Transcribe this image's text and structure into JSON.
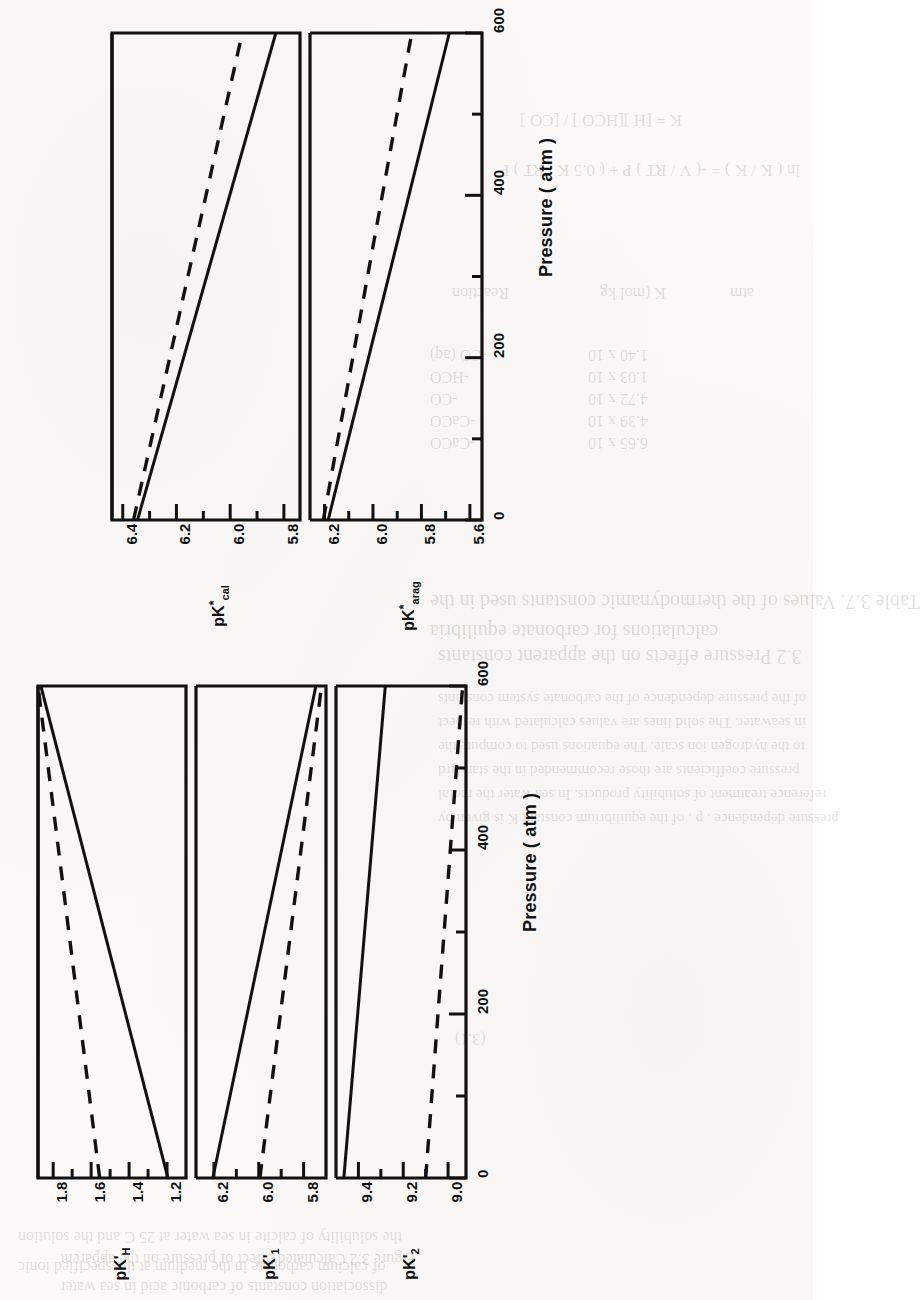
{
  "page": {
    "orientation": "rotated-90-ccw",
    "ghost_text": [
      {
        "t": "Table 3.7. Values of the thermodynamic constants used in the",
        "x": 430,
        "y": 590,
        "s": 20
      },
      {
        "t": "calculations for carbonate equilibria",
        "x": 430,
        "y": 620,
        "s": 20
      },
      {
        "t": "of the pressure dependence of the carbonate system constants",
        "x": 438,
        "y": 690,
        "s": 15
      },
      {
        "t": "in seawater. The solid lines are values calculated with respect",
        "x": 438,
        "y": 714,
        "s": 15
      },
      {
        "t": "to the hydrogen ion scale. The equations used to compute the",
        "x": 438,
        "y": 738,
        "s": 15
      },
      {
        "t": "pressure coefficients are those recommended in the standard",
        "x": 438,
        "y": 762,
        "s": 15
      },
      {
        "t": "reference treatment of solubility products. In sea water the molal",
        "x": 438,
        "y": 786,
        "s": 15
      },
      {
        "t": "pressure dependence , p , of the equilibrium constant K is given by",
        "x": 438,
        "y": 810,
        "s": 15
      },
      {
        "t": "(3.1)",
        "x": 455,
        "y": 1030,
        "s": 16
      },
      {
        "t": "Reaction",
        "x": 452,
        "y": 284,
        "s": 16
      },
      {
        "t": "K  (mol kg",
        "x": 600,
        "y": 284,
        "s": 16
      },
      {
        "t": "atm",
        "x": 730,
        "y": 284,
        "s": 16
      },
      {
        "t": "1.40 x 10",
        "x": 588,
        "y": 346,
        "s": 16
      },
      {
        "t": "1.03 x 10",
        "x": 588,
        "y": 368,
        "s": 16
      },
      {
        "t": "4.72 x 10",
        "x": 588,
        "y": 390,
        "s": 16
      },
      {
        "t": "4.39 x 10",
        "x": 588,
        "y": 412,
        "s": 16
      },
      {
        "t": "6.65 x 10",
        "x": 588,
        "y": 434,
        "s": 16
      },
      {
        "t": "-CO (aq)",
        "x": 430,
        "y": 346,
        "s": 16
      },
      {
        "t": "-HCO",
        "x": 430,
        "y": 368,
        "s": 16
      },
      {
        "t": "-CO",
        "x": 430,
        "y": 390,
        "s": 16
      },
      {
        "t": "-CaCO",
        "x": 430,
        "y": 412,
        "s": 16
      },
      {
        "t": "-CaCO",
        "x": 430,
        "y": 434,
        "s": 16
      },
      {
        "t": "K  = [H ][HCO ] / [CO ]",
        "x": 520,
        "y": 110,
        "s": 17
      },
      {
        "t": "ln ( K  / K  ) = -( V / RT ) P + ( 0.5 K / RT ) P",
        "x": 500,
        "y": 160,
        "s": 17
      },
      {
        "t": "3.2 Pressure effects on the apparent constants",
        "x": 438,
        "y": 645,
        "s": 20
      },
      {
        "t": "the solubility of calcite in sea water at 25 C and the solution",
        "x": 18,
        "y": 1228,
        "s": 16
      },
      {
        "t": "of calcium carbonate in the medium at the specified ionic",
        "x": 18,
        "y": 1258,
        "s": 16
      },
      {
        "t": "Figure 3.2  Calculated effect of pressure on the apparent",
        "x": 60,
        "y": 1250,
        "s": 16
      },
      {
        "t": "dissociation constants of carbonic acid in sea water",
        "x": 60,
        "y": 1278,
        "s": 16
      }
    ]
  },
  "chart_data": [
    {
      "id": "left-figure",
      "type": "line",
      "xlabel": "Pressure ( atm )",
      "xticks": [
        0,
        200,
        400,
        600
      ],
      "xminorticks": [
        100,
        300,
        500
      ],
      "xlim": [
        0,
        600
      ],
      "grid": false,
      "legend": null,
      "panels": [
        {
          "ylabel_plain": "pK'H",
          "ylabel_base": "pK",
          "ylabel_sub": "H",
          "ylabel_prime": "'",
          "ylim": [
            1.1,
            1.88
          ],
          "yticks": [
            1.2,
            1.4,
            1.6,
            1.8
          ],
          "yminorticks": [
            1.3,
            1.5,
            1.7
          ],
          "series": [
            {
              "name": "solid",
              "style": "solid",
              "x": [
                0,
                600
              ],
              "y": [
                1.195,
                1.865
              ]
            },
            {
              "name": "dashed",
              "style": "dashed",
              "x": [
                0,
                600
              ],
              "y": [
                1.555,
                1.88
              ]
            }
          ]
        },
        {
          "ylabel_plain": "pK'1",
          "ylabel_base": "pK",
          "ylabel_sub": "1",
          "ylabel_prime": "'",
          "ylim": [
            5.7,
            6.28
          ],
          "yticks": [
            5.8,
            6.0,
            6.2
          ],
          "yminorticks": [
            5.9,
            6.1
          ],
          "series": [
            {
              "name": "solid",
              "style": "solid",
              "x": [
                0,
                600
              ],
              "y": [
                6.205,
                5.745
              ]
            },
            {
              "name": "dashed",
              "style": "dashed",
              "x": [
                0,
                600
              ],
              "y": [
                5.995,
                5.72
              ]
            }
          ]
        },
        {
          "ylabel_plain": "pK'2",
          "ylabel_base": "pK",
          "ylabel_sub": "2",
          "ylabel_prime": "'",
          "ylim": [
            8.92,
            9.5
          ],
          "yticks": [
            9.0,
            9.2,
            9.4
          ],
          "yminorticks": [
            9.1,
            9.3
          ],
          "series": [
            {
              "name": "solid",
              "style": "solid",
              "x": [
                0,
                600
              ],
              "y": [
                9.465,
                9.28
              ]
            },
            {
              "name": "dashed",
              "style": "dashed",
              "x": [
                0,
                600
              ],
              "y": [
                9.1,
                8.935
              ]
            }
          ]
        }
      ]
    },
    {
      "id": "right-figure",
      "type": "line",
      "xlabel": "Pressure ( atm )",
      "xticks": [
        0,
        200,
        400,
        600
      ],
      "xminorticks": [
        100,
        300,
        500
      ],
      "xlim": [
        0,
        600
      ],
      "grid": false,
      "legend": null,
      "panels": [
        {
          "ylabel_plain": "pK*cal",
          "ylabel_base": "pK",
          "ylabel_sub": "cal",
          "ylabel_star": "*",
          "ylim": [
            5.74,
            6.44
          ],
          "yticks": [
            5.8,
            6.0,
            6.2,
            6.4
          ],
          "yminorticks": [
            5.9,
            6.1,
            6.3
          ],
          "series": [
            {
              "name": "solid",
              "style": "solid",
              "x": [
                0,
                600
              ],
              "y": [
                6.345,
                5.83
              ]
            },
            {
              "name": "dashed",
              "style": "dashed",
              "x": [
                0,
                600
              ],
              "y": [
                6.36,
                5.955
              ]
            }
          ]
        },
        {
          "ylabel_plain": "pK*arag",
          "ylabel_base": "pK",
          "ylabel_sub": "arag",
          "ylabel_star": "*",
          "ylim": [
            5.55,
            6.26
          ],
          "yticks": [
            5.6,
            5.8,
            6.0,
            6.2
          ],
          "yminorticks": [
            5.7,
            5.9,
            6.1
          ],
          "series": [
            {
              "name": "solid",
              "style": "solid",
              "x": [
                0,
                600
              ],
              "y": [
                6.185,
                5.685
              ]
            },
            {
              "name": "dashed",
              "style": "dashed",
              "x": [
                0,
                600
              ],
              "y": [
                6.205,
                5.84
              ]
            }
          ]
        }
      ]
    }
  ]
}
